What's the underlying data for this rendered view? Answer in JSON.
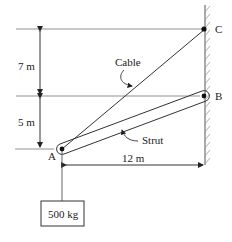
{
  "diagram": {
    "points": {
      "A": "A",
      "B": "B",
      "C": "C"
    },
    "labels": {
      "cable": "Cable",
      "strut": "Strut"
    },
    "dimensions": {
      "upper_vertical": "7 m",
      "lower_vertical": "5 m",
      "horizontal": "12 m"
    },
    "mass": "500 kg",
    "colors": {
      "line": "#333333",
      "guide": "#888888",
      "hatch": "#999999"
    }
  }
}
